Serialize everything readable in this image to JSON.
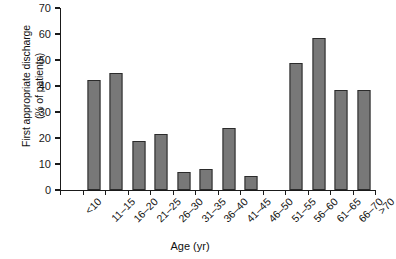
{
  "chart_data": {
    "type": "bar",
    "title": "",
    "subtitle": "",
    "xlabel": "Age (yr)",
    "ylabel": "First appropriate discharge (% of patients)",
    "ylabel_line1": "First appropriate discharge",
    "ylabel_line2": "(% of patients)",
    "categories": [
      "<10",
      "11–15",
      "16–20",
      "21–25",
      "26–30",
      "31–35",
      "36–40",
      "41–45",
      "46–50",
      "51–55",
      "56–60",
      "61–65",
      "66–70",
      ">70"
    ],
    "values": [
      0,
      42.5,
      45,
      19,
      21.5,
      7,
      8,
      24,
      5.5,
      0,
      49,
      58.5,
      38.5,
      38.5
    ],
    "ylim": [
      0,
      70
    ],
    "yticks": [
      0,
      10,
      20,
      30,
      40,
      50,
      60,
      70
    ],
    "ytick_labels": [
      "0",
      "10",
      "20",
      "30",
      "40",
      "50",
      "60",
      "70"
    ],
    "grid": false,
    "legend": "none",
    "bar_color": "#787878",
    "bar_edge_color": "#2b2b2b",
    "axis_color": "#1a1a1a"
  }
}
